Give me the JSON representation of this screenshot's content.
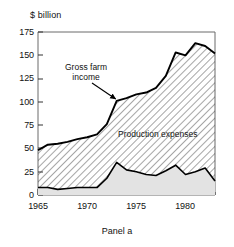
{
  "chart_data": {
    "type": "area",
    "title": "",
    "subtitle": "",
    "caption": "Panel a",
    "ylabel": "$ billion",
    "xlabel": "",
    "ylim": [
      0,
      175
    ],
    "xlim": [
      1965,
      1983
    ],
    "yticks": [
      0,
      25,
      50,
      75,
      100,
      125,
      150,
      175
    ],
    "ytick_labels": [
      "0",
      "25",
      "50",
      "75",
      "100",
      "125",
      "150",
      "175"
    ],
    "xticks": [
      1965,
      1970,
      1975,
      1980
    ],
    "xtick_labels": [
      "1965",
      "1970",
      "1975",
      "1980"
    ],
    "minor_xticks_every": 1,
    "grid": false,
    "legend_position": "inline-annotations",
    "annotations": [
      {
        "name": "gross-farm-income",
        "text": "Gross farm\nincome",
        "line1": "Gross farm",
        "line2": "income",
        "arrow": true,
        "arrow_target_year": 1973,
        "arrow_target_value": 101
      },
      {
        "name": "production-expenses",
        "text": "Production expenses",
        "arrow": false
      },
      {
        "name": "net-farm-income",
        "text": "Net farm income",
        "arrow": false
      }
    ],
    "x": [
      1965,
      1966,
      1967,
      1968,
      1969,
      1970,
      1971,
      1972,
      1973,
      1974,
      1975,
      1976,
      1977,
      1978,
      1979,
      1980,
      1981,
      1982,
      1983
    ],
    "series": [
      {
        "name": "Gross farm income",
        "role": "upper-boundary",
        "fill": "hatched",
        "color": "#000000",
        "values": [
          48,
          54,
          55,
          57,
          60,
          62,
          65,
          76,
          101,
          104,
          108,
          110,
          115,
          128,
          153,
          150,
          163,
          160,
          152
        ]
      },
      {
        "name": "Net farm income",
        "role": "lower-band",
        "fill": "solid-light-gray",
        "color": "#000000",
        "values": [
          8,
          8,
          6,
          7,
          8,
          8,
          8,
          18,
          35,
          27,
          25,
          22,
          21,
          26,
          32,
          22,
          25,
          29,
          15
        ]
      }
    ],
    "derived_series": [
      {
        "name": "Production expenses",
        "note": "hatched region between Net farm income and Gross farm income",
        "values": [
          40,
          46,
          49,
          50,
          52,
          54,
          57,
          58,
          66,
          77,
          83,
          88,
          94,
          102,
          121,
          128,
          138,
          131,
          137
        ]
      }
    ],
    "colors": {
      "hatch_stroke": "#3a3a3a",
      "net_fill": "#e3e3e3",
      "curve": "#000000",
      "frame": "#555555",
      "background": "#ffffff"
    }
  }
}
